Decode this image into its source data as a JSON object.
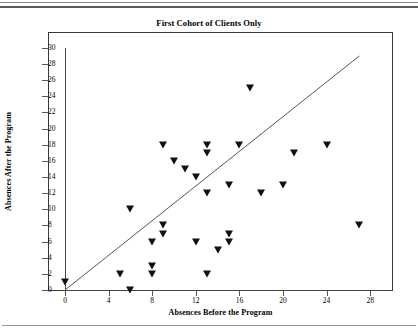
{
  "chart_data": {
    "type": "scatter",
    "title": "First Cohort of Clients Only",
    "xlabel": "Absences Before the Program",
    "ylabel": "Absences After the Program",
    "xlim": [
      -2,
      30
    ],
    "ylim": [
      0,
      30
    ],
    "x_ticks": [
      0,
      4,
      8,
      12,
      16,
      20,
      24,
      28
    ],
    "y_ticks": [
      0,
      2,
      4,
      6,
      8,
      10,
      12,
      14,
      16,
      18,
      20,
      22,
      24,
      26,
      28,
      30
    ],
    "grid": false,
    "legend": null,
    "marker": "filled-down-triangle",
    "marker_color": "#111111",
    "reference_line": {
      "description": "diagonal y = x reference line",
      "x_start": 0,
      "y_start": 0,
      "x_end": 27,
      "y_end": 29,
      "color": "#555555"
    },
    "points": [
      {
        "x": 0,
        "y": 1
      },
      {
        "x": 5,
        "y": 2
      },
      {
        "x": 6,
        "y": 0
      },
      {
        "x": 6,
        "y": 10
      },
      {
        "x": 8,
        "y": 2
      },
      {
        "x": 8,
        "y": 3
      },
      {
        "x": 8,
        "y": 6
      },
      {
        "x": 9,
        "y": 7
      },
      {
        "x": 9,
        "y": 8
      },
      {
        "x": 9,
        "y": 18
      },
      {
        "x": 10,
        "y": 16
      },
      {
        "x": 11,
        "y": 15
      },
      {
        "x": 12,
        "y": 6
      },
      {
        "x": 12,
        "y": 14
      },
      {
        "x": 13,
        "y": 2
      },
      {
        "x": 13,
        "y": 12
      },
      {
        "x": 13,
        "y": 18
      },
      {
        "x": 13,
        "y": 17
      },
      {
        "x": 14,
        "y": 5
      },
      {
        "x": 15,
        "y": 6
      },
      {
        "x": 15,
        "y": 7
      },
      {
        "x": 15,
        "y": 13
      },
      {
        "x": 16,
        "y": 18
      },
      {
        "x": 17,
        "y": 25
      },
      {
        "x": 18,
        "y": 12
      },
      {
        "x": 20,
        "y": 13
      },
      {
        "x": 21,
        "y": 17
      },
      {
        "x": 24,
        "y": 18
      },
      {
        "x": 27,
        "y": 8
      }
    ]
  },
  "axis": {
    "x_tick_labels": [
      "0",
      "4",
      "8",
      "12",
      "16",
      "20",
      "24",
      "28"
    ],
    "y_tick_labels": [
      "0",
      "2",
      "4",
      "6",
      "8",
      "10",
      "12",
      "14",
      "16",
      "18",
      "20",
      "22",
      "24",
      "26",
      "28",
      "30"
    ]
  }
}
